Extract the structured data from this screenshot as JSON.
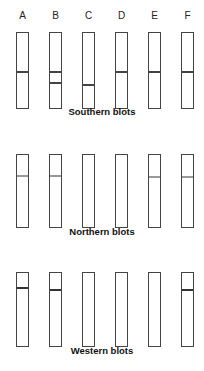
{
  "lane_labels": [
    "A",
    "B",
    "C",
    "D",
    "E",
    "F"
  ],
  "lane_x": [
    16,
    49,
    82,
    115,
    148,
    181
  ],
  "panels": [
    {
      "title": "Southern blots",
      "top": 32,
      "height": 75,
      "title_top": 112,
      "band_color": "#444444",
      "lanes": [
        {
          "label": "A",
          "bands": [
            39
          ]
        },
        {
          "label": "B",
          "bands": [
            39,
            50
          ]
        },
        {
          "label": "C",
          "bands": [
            52
          ]
        },
        {
          "label": "D",
          "bands": [
            39
          ]
        },
        {
          "label": "E",
          "bands": [
            39
          ]
        },
        {
          "label": "F",
          "bands": [
            39
          ]
        }
      ]
    },
    {
      "title": "Northern blots",
      "top": 154,
      "height": 72,
      "title_top": 232,
      "band_color": "#999999",
      "lanes": [
        {
          "label": "A",
          "bands": [
            21
          ]
        },
        {
          "label": "B",
          "bands": [
            21
          ]
        },
        {
          "label": "C",
          "bands": []
        },
        {
          "label": "D",
          "bands": []
        },
        {
          "label": "E",
          "bands": [
            22
          ]
        },
        {
          "label": "F",
          "bands": [
            22
          ]
        }
      ]
    },
    {
      "title": "Western blots",
      "top": 272,
      "height": 73,
      "title_top": 351,
      "band_color": "#333333",
      "lanes": [
        {
          "label": "A",
          "bands": [
            15
          ]
        },
        {
          "label": "B",
          "bands": [
            17
          ]
        },
        {
          "label": "C",
          "bands": []
        },
        {
          "label": "D",
          "bands": []
        },
        {
          "label": "E",
          "bands": []
        },
        {
          "label": "F",
          "bands": [
            17
          ]
        }
      ]
    }
  ]
}
